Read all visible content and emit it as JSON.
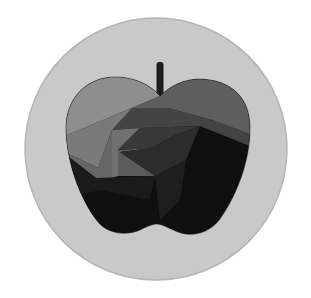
{
  "artwork": {
    "subject": "apple-icon",
    "description": "Stylized apple with spiral polygon shading inside a gray circle",
    "colors": {
      "page_background": "#ffffff",
      "circle_fill": "#c9c9c9",
      "circle_edge": "#b5b5b5",
      "stem": "#1c1c1c",
      "apple_base": "#0f0f0f",
      "facet_light": "#8e8e8e",
      "facet_mid_light": "#7a7a7a",
      "facet_mid": "#5e5e5e",
      "facet_mid_dark": "#444444",
      "facet_dark": "#2c2c2c",
      "facet_darker": "#1e1e1e"
    }
  }
}
